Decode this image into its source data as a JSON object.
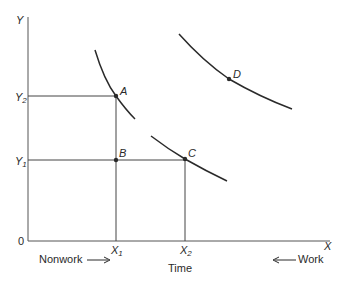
{
  "diagram": {
    "axes": {
      "y_label": "Y",
      "x_label": "X",
      "origin_label": "0",
      "y_ticks": [
        {
          "base": "Y",
          "sub": "2"
        },
        {
          "base": "Y",
          "sub": "1"
        }
      ],
      "x_ticks": [
        {
          "base": "X",
          "sub": "1"
        },
        {
          "base": "X",
          "sub": "2"
        }
      ],
      "x_title": "Time",
      "left_annotation": "Nonwork",
      "right_annotation": "Work"
    },
    "points": [
      {
        "label": "A"
      },
      {
        "label": "B"
      },
      {
        "label": "C"
      },
      {
        "label": "D"
      }
    ],
    "colors": {
      "line": "#2a2a2a",
      "background": "#ffffff"
    }
  }
}
